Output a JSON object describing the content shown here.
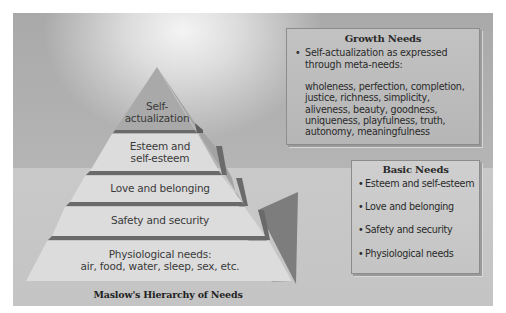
{
  "diagram": {
    "caption": "Maslow's Hierarchy of Needs",
    "pyramid": {
      "tiers": [
        {
          "line1": "Self-",
          "line2": "actualization"
        },
        {
          "line1": "Esteem and",
          "line2": "self-esteem"
        },
        {
          "line1": "Love and belonging",
          "line2": ""
        },
        {
          "line1": "Safety and security",
          "line2": ""
        },
        {
          "line1": "Physiological needs:",
          "line2": "air, food, water, sleep, sex, etc."
        }
      ]
    },
    "growth_needs": {
      "title": "Growth Needs",
      "bullet_marker": "•",
      "bullet": "Self-actualization as expressed through meta-needs:",
      "meta_needs": "wholeness, perfection, completion, justice, richness, simplicity, aliveness, beauty, goodness, uniqueness, playfulness, truth, autonomy, meaningfulness"
    },
    "basic_needs": {
      "title": "Basic Needs",
      "bullet_marker": "•",
      "items": [
        "Esteem and self-esteem",
        "Love and belonging",
        "Safety and security",
        "Physiological needs"
      ]
    },
    "colors": {
      "background": "#b4b4b4",
      "tier_face": "#dcdcdc",
      "tier_top": "#a0a0a0",
      "tier_ledge": "#6e6e6e",
      "side_face": "#a8a8a8",
      "shadow_face": "#7a7a7a"
    }
  }
}
